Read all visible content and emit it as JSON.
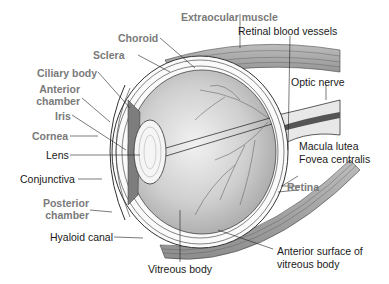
{
  "figure": {
    "labels": {
      "choroid": "Choroid",
      "extraocular_muscle": "Extraocular muscle",
      "retinal_blood_vessels": "Retinal blood vessels",
      "sclera": "Sclera",
      "ciliary_body": "Ciliary body",
      "anterior_chamber_1": "Anterior",
      "anterior_chamber_2": "chamber",
      "optic_nerve": "Optic nerve",
      "iris": "Iris",
      "cornea": "Cornea",
      "lens": "Lens",
      "macula_lutea": "Macula lutea",
      "fovea_centralis": "Fovea centralis",
      "conjunctiva": "Conjunctiva",
      "retina": "Retina",
      "posterior_chamber_1": "Posterior",
      "posterior_chamber_2": "chamber",
      "hyaloid_canal": "Hyaloid canal",
      "anterior_surface_1": "Anterior surface of",
      "anterior_surface_2": "vitreous body",
      "vitreous_body": "Vitreous body"
    },
    "colors": {
      "gray_label": "#7a7a7a",
      "black_label": "#1a1a1a",
      "vitreous_fill": "#c8c8c8"
    }
  }
}
